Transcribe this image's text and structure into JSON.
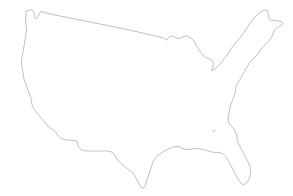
{
  "figure": {
    "title": "Blank outline map of the contiguous United States",
    "caption": "",
    "width": 293,
    "height": 196
  },
  "style": {
    "background_color": "#ffffff",
    "outline_color": "#8c8c8c",
    "fill_color": "#ffffff",
    "speck_color": "#c9c9c9",
    "outline_width": 0.55
  },
  "map_data": {
    "type": "outline",
    "region": "Contiguous United States",
    "projection": "unspecified",
    "labels": [],
    "legend": [],
    "graticule": false,
    "features": [
      {
        "name": "contiguous-us-landmass",
        "kind": "polygon",
        "points": "26.5,11.0 31.5,9.5 34.0,12.5 34.5,17.0 36.5,19.0 38.0,16.5 39.5,13.5 41.0,11.5 43.5,12.0 47.0,13.2 52.0,14.4 58.0,15.6 65.0,17.0 73.0,18.6 82.0,20.4 92.0,22.4 102.0,24.4 112.0,26.4 122.0,28.4 131.0,30.4 139.0,32.2 146.0,33.8 152.0,35.2 157.0,36.4 161.0,37.4 164.5,38.6 167.0,40.2 168.5,37.8 170.5,36.2 173.0,36.0 175.5,37.4 178.0,38.6 180.5,38.0 183.0,36.6 186.0,36.0 189.0,36.8 192.0,38.8 194.0,41.0 195.5,43.8 197.0,46.6 199.0,49.6 201.0,52.6 203.0,55.2 205.5,57.2 208.0,58.4 210.5,59.2 212.5,60.6 213.5,63.0 213.0,66.0 212.0,68.6 211.5,70.6 213.0,70.2 215.5,68.2 218.5,65.6 221.0,62.8 223.5,59.6 226.0,56.6 228.0,53.8 229.5,51.0 231.5,48.2 233.5,45.6 235.5,43.2 237.5,41.0 239.5,38.6 241.5,36.0 243.5,33.2 245.5,30.2 247.5,27.0 250.0,23.4 252.5,20.0 255.0,17.0 257.5,14.4 260.0,12.4 262.5,11.0 265.0,10.0 267.0,10.4 268.0,12.4 268.5,15.2 269.0,18.0 270.5,19.8 273.0,20.4 276.0,20.6 279.0,21.0 281.5,21.8 283.0,23.2 282.0,25.0 279.5,26.4 277.0,27.8 275.0,29.6 273.5,32.0 272.5,34.6 271.5,37.2 270.0,39.6 268.0,41.8 266.0,43.8 264.0,45.6 262.0,47.6 260.5,50.0 259.0,52.6 257.0,55.0 255.0,57.0 253.0,59.0 251.0,61.2 249.0,63.6 247.5,66.2 246.0,68.8 244.5,71.4 243.0,74.0 241.5,76.6 240.0,79.2 238.5,81.8 237.0,84.4 236.0,87.2 235.5,90.2 235.0,93.2 234.0,96.0 233.0,98.8 232.0,101.6 231.0,104.4 230.0,107.2 229.5,110.0 229.0,113.0 228.5,116.0 228.0,119.0 228.5,122.0 230.0,124.6 232.0,126.8 234.0,129.0 235.5,131.6 236.5,134.6 237.0,137.8 237.5,141.0 238.5,144.0 240.0,146.8 241.5,149.6 243.0,152.4 244.5,155.2 246.0,158.0 247.5,160.8 249.0,163.6 250.0,166.6 250.5,169.8 250.5,173.0 250.0,176.2 249.0,179.2 247.5,181.8 245.5,183.8 243.5,184.6 241.5,183.8 240.0,182.0 238.5,179.6 237.0,177.0 235.5,174.2 234.0,171.4 232.5,168.6 231.0,165.8 229.5,163.0 228.0,160.2 226.5,157.6 224.5,155.4 222.5,153.6 220.0,152.6 217.5,152.4 215.0,152.4 212.0,152.0 209.0,151.2 206.0,150.4 203.0,149.6 200.0,148.8 197.0,148.4 194.0,148.6 191.0,149.2 188.0,149.6 185.0,149.4 182.5,148.4 180.0,147.0 177.0,146.4 174.0,146.8 171.0,147.8 168.0,149.2 165.0,150.8 162.0,152.6 159.0,154.4 156.5,156.6 154.5,159.2 153.0,162.0 152.0,165.0 151.0,168.0 150.0,171.0 149.0,174.0 148.0,177.0 147.0,180.0 146.0,183.0 145.0,186.0 143.5,188.2 141.5,187.6 140.0,185.4 138.5,182.8 137.0,180.0 135.5,177.2 134.0,174.4 132.0,172.0 129.5,170.0 127.0,168.2 124.5,166.4 122.0,164.4 119.5,162.2 117.5,159.8 116.0,157.2 114.5,154.6 112.5,152.6 110.0,151.4 107.5,151.0 105.0,151.0 102.0,151.0 99.0,151.0 96.0,151.0 93.0,151.0 90.0,151.0 87.0,151.0 84.0,150.6 81.5,149.6 79.5,148.0 78.0,146.0 77.5,143.6 77.0,141.2 74.5,140.6 72.0,140.4 69.0,140.2 66.0,139.8 63.0,139.2 60.5,138.0 58.5,136.2 57.0,134.0 55.5,131.8 53.5,130.0 51.0,128.4 48.5,126.6 46.5,124.4 44.5,122.0 42.5,119.6 40.5,117.2 38.5,114.8 36.5,112.4 34.5,110.0 33.0,107.4 32.0,104.6 31.5,101.6 31.0,98.6 30.0,95.8 29.0,93.0 28.0,90.2 27.0,87.4 26.0,84.6 25.0,81.8 24.0,79.0 23.5,76.0 23.0,73.0 22.5,70.0 22.0,67.0 21.5,64.0 21.5,61.0 22.0,58.0 22.5,55.0 23.0,52.0 23.5,49.0 24.0,46.0 24.5,43.0 25.0,40.0 25.5,37.0 26.0,34.0 26.5,31.0 26.5,28.0 26.0,25.0 25.5,22.0 25.5,19.0 26.0,16.0 26.0,13.5",
        "description": "Outer coastline and national border of the lower 48 states"
      },
      {
        "name": "florida-peninsula-tip",
        "kind": "vertex-note",
        "x": 247,
        "y": 181,
        "description": "Southern tip of Florida"
      },
      {
        "name": "texas-southern-tip",
        "kind": "vertex-note",
        "x": 144,
        "y": 188,
        "description": "Southernmost point of Texas at the Rio Grande mouth"
      },
      {
        "name": "maine-northeast-corner",
        "kind": "vertex-note",
        "x": 267,
        "y": 10,
        "description": "Northernmost point of Maine"
      },
      {
        "name": "puget-sound-notch",
        "kind": "vertex-note",
        "x": 34,
        "y": 14,
        "description": "Notch at Puget Sound in northwest Washington"
      },
      {
        "name": "pacific-coast-west-edge",
        "kind": "vertex-note",
        "x": 21,
        "y": 64,
        "description": "Westernmost point of the California-Oregon coast"
      },
      {
        "name": "great-lakes-northern-border",
        "kind": "vertex-note",
        "x": 190,
        "y": 38,
        "description": "Great Lakes section of the northern border"
      }
    ],
    "specks": [
      {
        "name": "artifact-speck",
        "x": 213.5,
        "y": 129.5,
        "w": 1.6,
        "h": 2.4
      },
      {
        "name": "artifact-speck",
        "x": 212.0,
        "y": 131.0,
        "w": 1.0,
        "h": 1.0
      }
    ]
  }
}
